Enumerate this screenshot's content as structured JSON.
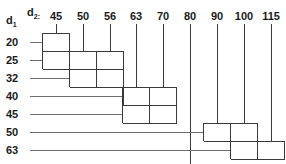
{
  "labels": {
    "row_axis": "d",
    "row_axis_sub": "1",
    "col_axis": "d",
    "col_axis_sub": "2:"
  },
  "chart_data": {
    "type": "table",
    "title": "",
    "subtitle": "",
    "xlabel": "d2",
    "ylabel": "d1",
    "grid": false,
    "legend": "none",
    "categories": [
      "45",
      "50",
      "56",
      "63",
      "70",
      "80",
      "90",
      "100",
      "115"
    ],
    "row_categories": [
      "20",
      "25",
      "32",
      "40",
      "45",
      "50",
      "63"
    ],
    "rows": [
      {
        "d1": "20",
        "d2_start": "45",
        "d2_end": "45",
        "start_col": 0,
        "end_col": 0
      },
      {
        "d1": "25",
        "d2_start": "45",
        "d2_end": "56",
        "start_col": 0,
        "end_col": 2
      },
      {
        "d1": "32",
        "d2_start": "50",
        "d2_end": "56",
        "start_col": 1,
        "end_col": 2
      },
      {
        "d1": "40",
        "d2_start": "63",
        "d2_end": "70",
        "start_col": 3,
        "end_col": 4
      },
      {
        "d1": "45",
        "d2_start": "63",
        "d2_end": "70",
        "start_col": 3,
        "end_col": 4
      },
      {
        "d1": "50",
        "d2_start": "90",
        "d2_end": "100",
        "start_col": 6,
        "end_col": 7
      },
      {
        "d1": "63",
        "d2_start": "100",
        "d2_end": "115",
        "start_col": 7,
        "end_col": 8
      }
    ]
  },
  "colors": {
    "line": "#3a3a3a",
    "leader": "#6e6e6e",
    "text": "#1a1a1a",
    "background": "#ffffff"
  },
  "geometry": {
    "col_x": [
      56,
      83,
      110,
      136,
      163,
      190,
      217,
      244,
      271
    ],
    "row_y": [
      42,
      60,
      78,
      96,
      114,
      132,
      150
    ],
    "col_step": 27,
    "row_step": 18,
    "left_margin": 30,
    "header_y": 10,
    "tick_top": 24
  }
}
